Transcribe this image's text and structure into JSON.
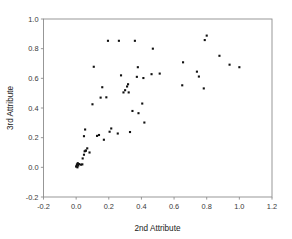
{
  "chart_data": {
    "type": "scatter",
    "title": "",
    "xlabel": "2nd Attribute",
    "ylabel": "3rd Attribute",
    "xlim": [
      -0.2,
      1.2
    ],
    "ylim": [
      -0.2,
      1.0
    ],
    "xticks": [
      "-0.2",
      "0.0",
      "0.2",
      "0.4",
      "0.6",
      "0.8",
      "1.0",
      "1.2"
    ],
    "xtick_values": [
      -0.2,
      0.0,
      0.2,
      0.4,
      0.6,
      0.8,
      1.0,
      1.2
    ],
    "yticks": [
      "-0.2",
      "0.0",
      "0.2",
      "0.4",
      "0.6",
      "0.8",
      "1.0"
    ],
    "ytick_values": [
      -0.2,
      0.0,
      0.2,
      0.4,
      0.6,
      0.8,
      1.0
    ],
    "grid": false,
    "legend": false,
    "marker": "square",
    "marker_color": "#111111",
    "marker_size": 2.1,
    "series": [
      {
        "name": "observations",
        "points": [
          [
            0.0,
            0.005
          ],
          [
            0.003,
            0.01
          ],
          [
            0.005,
            0.02
          ],
          [
            0.008,
            0.0
          ],
          [
            0.01,
            0.028
          ],
          [
            0.013,
            0.012
          ],
          [
            0.018,
            0.022
          ],
          [
            0.03,
            0.018
          ],
          [
            0.038,
            0.02
          ],
          [
            0.04,
            0.06
          ],
          [
            0.048,
            0.085
          ],
          [
            0.052,
            0.108
          ],
          [
            0.058,
            0.112
          ],
          [
            0.06,
            0.113
          ],
          [
            0.068,
            0.128
          ],
          [
            0.048,
            0.21
          ],
          [
            0.055,
            0.255
          ],
          [
            0.082,
            0.1
          ],
          [
            0.1,
            0.425
          ],
          [
            0.108,
            0.678
          ],
          [
            0.128,
            0.212
          ],
          [
            0.14,
            0.218
          ],
          [
            0.15,
            0.47
          ],
          [
            0.16,
            0.54
          ],
          [
            0.17,
            0.186
          ],
          [
            0.185,
            0.472
          ],
          [
            0.195,
            0.853
          ],
          [
            0.205,
            0.24
          ],
          [
            0.215,
            0.262
          ],
          [
            0.255,
            0.228
          ],
          [
            0.262,
            0.853
          ],
          [
            0.275,
            0.62
          ],
          [
            0.29,
            0.505
          ],
          [
            0.3,
            0.52
          ],
          [
            0.312,
            0.545
          ],
          [
            0.318,
            0.56
          ],
          [
            0.322,
            0.505
          ],
          [
            0.33,
            0.238
          ],
          [
            0.345,
            0.38
          ],
          [
            0.36,
            0.853
          ],
          [
            0.372,
            0.61
          ],
          [
            0.378,
            0.675
          ],
          [
            0.382,
            0.365
          ],
          [
            0.405,
            0.43
          ],
          [
            0.412,
            0.602
          ],
          [
            0.418,
            0.302
          ],
          [
            0.462,
            0.628
          ],
          [
            0.47,
            0.8
          ],
          [
            0.512,
            0.632
          ],
          [
            0.65,
            0.553
          ],
          [
            0.655,
            0.708
          ],
          [
            0.74,
            0.645
          ],
          [
            0.752,
            0.612
          ],
          [
            0.782,
            0.532
          ],
          [
            0.788,
            0.858
          ],
          [
            0.8,
            0.888
          ],
          [
            0.878,
            0.752
          ],
          [
            0.94,
            0.692
          ],
          [
            1.0,
            0.675
          ]
        ]
      }
    ]
  },
  "axes": {
    "x_title": "2nd Attribute",
    "y_title": "3rd Attribute"
  }
}
